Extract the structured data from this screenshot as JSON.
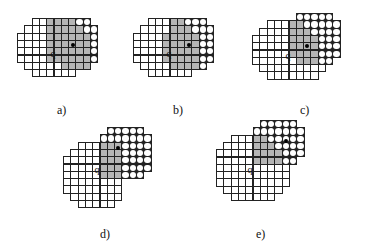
{
  "figure": {
    "cell_size": 8.3,
    "colors": {
      "overlap_gray": "#b5b5b5",
      "grid_line": "#222222",
      "circle": "#ffffff"
    },
    "legend_note": "W = cell of q-region, G = overlap region, O = new (circle) cells, D = moving point",
    "panels": [
      {
        "id": "a",
        "caption": "a)",
        "x": 17,
        "y": 18,
        "caption_x": 57,
        "caption_y": 103,
        "q_label": "q",
        "q_col": 4.6,
        "q_row": 4.3,
        "dot_col": 7.4,
        "dot_row": 3.4,
        "rows": [
          "..WWGGGGOO.",
          ".WWWGGGGGOO",
          "WWWWGGGGGGO",
          "WWWWGGGGGGO",
          "WWWWGGGGGGO",
          "WWWWGGGGGGO",
          ".WWWWWGGGG.",
          "..WWWWWW..."
        ]
      },
      {
        "id": "b",
        "caption": "b)",
        "x": 133,
        "y": 18,
        "caption_x": 173,
        "caption_y": 103,
        "q_label": "q",
        "q_col": 4.6,
        "q_row": 4.3,
        "dot_col": 7.4,
        "dot_row": 3.4,
        "rows": [
          "..WWWGGOOO.",
          ".WWWWGGGOOO",
          "WWWWGGGGGOO",
          "WWWWGGGGGOO",
          "WWWWGGGGGOO",
          "WWWWGGGGGOO",
          ".WWWWGGGGO.",
          "..WWWWWW..."
        ]
      },
      {
        "id": "c",
        "caption": "c)",
        "x": 252,
        "y": 13,
        "caption_x": 300,
        "caption_y": 103,
        "q_label": "q",
        "q_col": 4.6,
        "q_row": 5.2,
        "dot_col": 7.3,
        "dot_row": 4.2,
        "rows": [
          "......OOOOO.",
          "..WWWGGOOOOO",
          ".WWWWGGGOOOO",
          "WWWWWGGGGOOO",
          "WWWWWGGGGOOO",
          "WWWWWGGGGOOO",
          "WWWWWWGGGOO.",
          ".WWWWWWWWW..",
          "..WWWWWWW..."
        ]
      },
      {
        "id": "d",
        "caption": "d)",
        "x": 63,
        "y": 127,
        "caption_x": 100,
        "caption_y": 227,
        "q_label": "q",
        "q_col": 4.3,
        "q_row": 5.2,
        "dot_col": 7.2,
        "dot_row": 2.6,
        "rows": [
          "......OOOOO.",
          ".....OOOOOOO",
          "..WWWGGGOOOO",
          ".WWWWGGGDOOO",
          "WWWWWGGGOOOO",
          "WWWWWGGGOOOO",
          "WWWWWGGGOOO.",
          "WWWWWWWW....",
          "WWWWWWWW....",
          ".WWWWWWW....",
          "..WWWWW....."
        ]
      },
      {
        "id": "e",
        "caption": "e)",
        "x": 216,
        "y": 120,
        "caption_x": 256,
        "caption_y": 227,
        "q_label": "q",
        "q_col": 4.3,
        "q_row": 6.2,
        "dot_col": 9.3,
        "dot_row": 2.6,
        "rows": [
          "......OOOOO.",
          ".....OOOOOOO",
          "..WWWGGOOOOO",
          ".WWWWGGGOOOO",
          "WWWWWGGGGOOO",
          "WWWWWGGGGOO.",
          "WWWWWWWWWW..",
          "WWWWWWWWWW..",
          "WWWWWWWWWW..",
          ".WWWWWWWW...",
          "..WWWWWW...."
        ]
      }
    ]
  }
}
